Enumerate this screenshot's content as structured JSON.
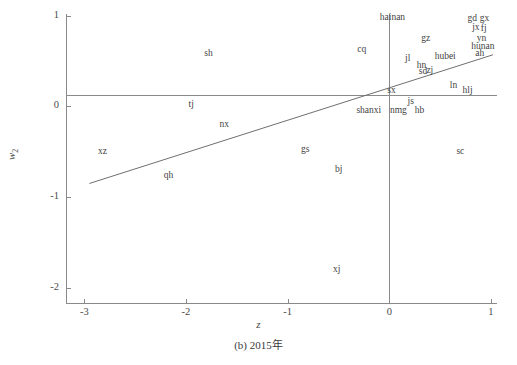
{
  "chart_data": {
    "type": "scatter",
    "title": "",
    "caption": "(b) 2015年",
    "xlabel": "z",
    "ylabel": "w",
    "ylabel_sub": "2",
    "xlim": [
      -3.18,
      1.06
    ],
    "ylim": [
      -2.18,
      1.02
    ],
    "xticks": [
      "-3",
      "-2",
      "-1",
      "0",
      "1"
    ],
    "xtick_values": [
      -3,
      -2,
      -1,
      0,
      1
    ],
    "yticks": [
      "1",
      "0",
      "-1",
      "-2"
    ],
    "ytick_values": [
      1,
      0,
      -1,
      -2
    ],
    "grid": false,
    "legend": "none",
    "marker_style": "text-label",
    "reference_lines": [
      {
        "name": "horizontal-reference-line",
        "orientation": "horizontal",
        "y": 0.13
      },
      {
        "name": "vertical-reference-line",
        "orientation": "vertical",
        "x": 0.0
      }
    ],
    "fit_line": {
      "name": "regression-line",
      "x0": -2.95,
      "y0": -0.85,
      "x1": 1.02,
      "y1": 0.57
    },
    "points": [
      {
        "label": "hainan",
        "x": 0.03,
        "y": 0.98
      },
      {
        "label": "gd",
        "x": 0.82,
        "y": 0.96
      },
      {
        "label": "gx",
        "x": 0.94,
        "y": 0.97
      },
      {
        "label": "jx",
        "x": 0.85,
        "y": 0.87
      },
      {
        "label": "fj",
        "x": 0.93,
        "y": 0.85
      },
      {
        "label": "yn",
        "x": 0.91,
        "y": 0.74
      },
      {
        "label": "hunan",
        "x": 0.92,
        "y": 0.66
      },
      {
        "label": "ah",
        "x": 0.89,
        "y": 0.58
      },
      {
        "label": "gz",
        "x": 0.36,
        "y": 0.74
      },
      {
        "label": "cq",
        "x": -0.27,
        "y": 0.62
      },
      {
        "label": "sh",
        "x": -1.78,
        "y": 0.58
      },
      {
        "label": "hubei",
        "x": 0.55,
        "y": 0.55
      },
      {
        "label": "jl",
        "x": 0.18,
        "y": 0.52
      },
      {
        "label": "hn",
        "x": 0.32,
        "y": 0.45
      },
      {
        "label": "sd",
        "x": 0.33,
        "y": 0.38
      },
      {
        "label": "zj",
        "x": 0.4,
        "y": 0.39
      },
      {
        "label": "sx",
        "x": 0.02,
        "y": 0.17
      },
      {
        "label": "ln",
        "x": 0.63,
        "y": 0.23
      },
      {
        "label": "hlj",
        "x": 0.77,
        "y": 0.17
      },
      {
        "label": "js",
        "x": 0.21,
        "y": 0.05
      },
      {
        "label": "tj",
        "x": -1.95,
        "y": 0.02
      },
      {
        "label": "shanxi",
        "x": -0.2,
        "y": -0.05
      },
      {
        "label": "nmg",
        "x": 0.09,
        "y": -0.05
      },
      {
        "label": "hb",
        "x": 0.3,
        "y": -0.05
      },
      {
        "label": "nx",
        "x": -1.62,
        "y": -0.2
      },
      {
        "label": "xz",
        "x": -2.82,
        "y": -0.5
      },
      {
        "label": "gs",
        "x": -0.83,
        "y": -0.48
      },
      {
        "label": "sc",
        "x": 0.7,
        "y": -0.5
      },
      {
        "label": "qh",
        "x": -2.17,
        "y": -0.77
      },
      {
        "label": "bj",
        "x": -0.5,
        "y": -0.7
      },
      {
        "label": "xj",
        "x": -0.52,
        "y": -1.8
      }
    ]
  }
}
